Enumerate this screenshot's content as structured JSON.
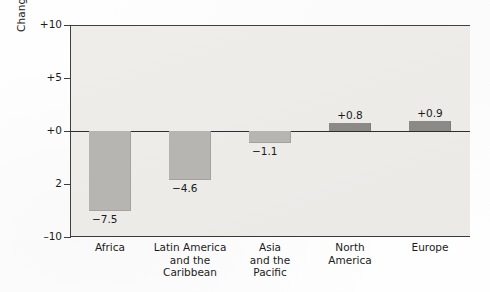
{
  "chart_data": {
    "type": "bar",
    "title": "",
    "subtitle": "",
    "xlabel": "",
    "ylabel": "Change in forested land, 1990–2000 (percent)",
    "categories": [
      "Africa",
      "Latin America\nand the\nCaribbean",
      "Asia\nand the\nPacific",
      "North\nAmerica",
      "Europe"
    ],
    "values": [
      -7.5,
      -4.6,
      -1.1,
      0.8,
      0.9
    ],
    "value_labels": [
      "−7.5",
      "−4.6",
      "−1.1",
      "+0.8",
      "+0.9"
    ],
    "ylim": [
      -10,
      10
    ],
    "ytick_values": [
      10,
      5,
      0,
      -5,
      -10
    ],
    "ytick_labels": [
      "+10",
      "+5",
      "+0",
      "2",
      "–10"
    ],
    "grid": false,
    "legend": null,
    "legend_position": "none",
    "colors": {
      "negative_bar": "#b6b5b2",
      "positive_bar": "#8b8a87",
      "plot_background": "#f1f0ed",
      "axis": "#3a3a3a",
      "text": "#1b1b1b"
    }
  }
}
